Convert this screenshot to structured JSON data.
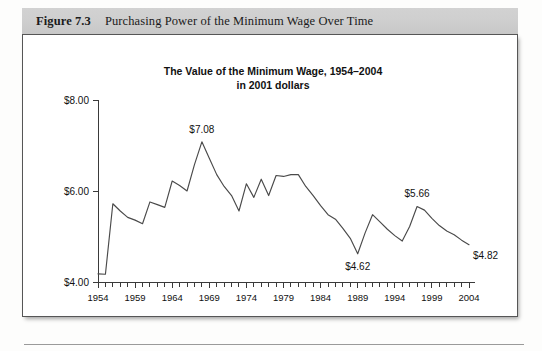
{
  "figure": {
    "number_label": "Figure 7.3",
    "caption": "Purchasing Power of the Minimum Wage Over Time"
  },
  "chart_data": {
    "type": "line",
    "title": "The Value of the Minimum Wage, 1954–2004",
    "subtitle": "in 2001 dollars",
    "title_lines": [
      "The Value of the Minimum Wage, 1954–2004",
      "in 2001 dollars"
    ],
    "xlabel": "",
    "ylabel": "",
    "xlim": [
      1954,
      2004
    ],
    "ylim": [
      4.0,
      8.0
    ],
    "grid": false,
    "legend": "none",
    "ytick_labels": [
      "$8.00",
      "$6.00",
      "$4.00"
    ],
    "ytick_values": [
      8.0,
      6.0,
      4.0
    ],
    "xtick_labels": [
      "1954",
      "1959",
      "1964",
      "1969",
      "1974",
      "1979",
      "1984",
      "1989",
      "1994",
      "1999",
      "2004"
    ],
    "xtick_values": [
      1954,
      1959,
      1964,
      1969,
      1974,
      1979,
      1984,
      1989,
      1994,
      1999,
      2004
    ],
    "x_minor_tick_step": 1,
    "x": [
      1954,
      1955,
      1956,
      1957,
      1958,
      1959,
      1960,
      1961,
      1962,
      1963,
      1964,
      1965,
      1966,
      1967,
      1968,
      1969,
      1970,
      1971,
      1972,
      1973,
      1974,
      1975,
      1976,
      1977,
      1978,
      1979,
      1980,
      1981,
      1982,
      1983,
      1984,
      1985,
      1986,
      1987,
      1988,
      1989,
      1990,
      1991,
      1992,
      1993,
      1994,
      1995,
      1996,
      1997,
      1998,
      1999,
      2000,
      2001,
      2002,
      2003,
      2004
    ],
    "values": [
      4.18,
      4.17,
      5.72,
      5.56,
      5.42,
      5.36,
      5.28,
      5.76,
      5.7,
      5.64,
      6.22,
      6.12,
      6.0,
      6.58,
      7.08,
      6.72,
      6.36,
      6.1,
      5.9,
      5.56,
      6.16,
      5.86,
      6.26,
      5.9,
      6.34,
      6.32,
      6.36,
      6.36,
      6.1,
      5.9,
      5.68,
      5.48,
      5.38,
      5.18,
      4.96,
      4.62,
      5.08,
      5.48,
      5.32,
      5.16,
      5.02,
      4.9,
      5.22,
      5.66,
      5.58,
      5.4,
      5.24,
      5.12,
      5.04,
      4.92,
      4.82
    ],
    "annotations": [
      {
        "label": "$7.08",
        "year": 1968,
        "value": 7.08,
        "position": "above"
      },
      {
        "label": "$4.62",
        "year": 1989,
        "value": 4.62,
        "position": "below"
      },
      {
        "label": "$5.66",
        "year": 1997,
        "value": 5.66,
        "position": "above"
      },
      {
        "label": "$4.82",
        "year": 2004,
        "value": 4.82,
        "position": "right-below"
      }
    ],
    "series": [
      {
        "name": "Minimum wage in 2001 dollars",
        "values": [
          4.18,
          4.17,
          5.72,
          5.56,
          5.42,
          5.36,
          5.28,
          5.76,
          5.7,
          5.64,
          6.22,
          6.12,
          6.0,
          6.58,
          7.08,
          6.72,
          6.36,
          6.1,
          5.9,
          5.56,
          6.16,
          5.86,
          6.26,
          5.9,
          6.34,
          6.32,
          6.36,
          6.36,
          6.1,
          5.9,
          5.68,
          5.48,
          5.38,
          5.18,
          4.96,
          4.62,
          5.08,
          5.48,
          5.32,
          5.16,
          5.02,
          4.9,
          5.22,
          5.66,
          5.58,
          5.4,
          5.24,
          5.12,
          5.04,
          4.92,
          4.82
        ]
      }
    ]
  },
  "colors": {
    "caption_bar": "#cfcfcf",
    "line": "#4a4a4a",
    "axis": "#3a3a3a",
    "panel_border": "#565656",
    "text": "#111111"
  }
}
